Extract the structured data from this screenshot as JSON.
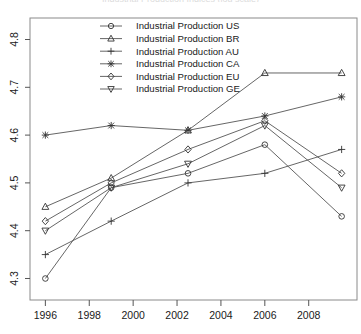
{
  "chart_data": {
    "type": "line",
    "title": "Industrial Production Indices (log scale)",
    "xlabel": "",
    "ylabel": "",
    "x": [
      1996,
      1999,
      2002.5,
      2006,
      2009.5
    ],
    "xlim": [
      1995.3,
      2010.2
    ],
    "ylim": [
      4.255,
      4.845
    ],
    "xticks": [
      1996,
      1998,
      2000,
      2002,
      2004,
      2006,
      2008
    ],
    "yticks": [
      4.3,
      4.4,
      4.5,
      4.6,
      4.7,
      4.8
    ],
    "xticklabels": [
      "1996",
      "1998",
      "2000",
      "2002",
      "2004",
      "2006",
      "2008"
    ],
    "yticklabels": [
      "4.3",
      "4.4",
      "4.5",
      "4.6",
      "4.7",
      "4.8"
    ],
    "grid": false,
    "legend_position": "top-center",
    "line_color": "#555555",
    "marker_color": "#333333",
    "series": [
      {
        "name": "Industrial Production US",
        "code": "US",
        "marker": "circle",
        "values": [
          4.3,
          4.49,
          4.52,
          4.58,
          4.43
        ]
      },
      {
        "name": "Industrial Production BR",
        "code": "BR",
        "marker": "triangle-up",
        "values": [
          4.45,
          4.51,
          4.61,
          4.73,
          4.73
        ]
      },
      {
        "name": "Industrial Production AU",
        "code": "AU",
        "marker": "plus",
        "values": [
          4.35,
          4.42,
          4.5,
          4.52,
          4.57
        ]
      },
      {
        "name": "Industrial Production CA",
        "code": "CA",
        "marker": "x",
        "values": [
          4.6,
          4.62,
          4.61,
          4.64,
          4.68
        ]
      },
      {
        "name": "Industrial Production EU",
        "code": "EU",
        "marker": "diamond",
        "values": [
          4.42,
          4.5,
          4.57,
          4.63,
          4.52
        ]
      },
      {
        "name": "Industrial Production GE",
        "code": "GE",
        "marker": "triangle-down",
        "values": [
          4.4,
          4.49,
          4.54,
          4.62,
          4.49
        ]
      }
    ]
  }
}
